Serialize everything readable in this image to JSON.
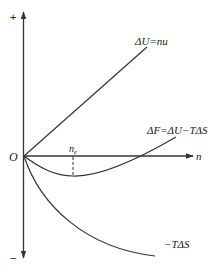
{
  "diagram": {
    "axes": {
      "y_plus_label": "+",
      "y_minus_label": "−",
      "origin_label": "O",
      "x_label": "n"
    },
    "curves": [
      {
        "id": "delta-u",
        "label": "ΔU=nu",
        "shape": "straight line rising from origin"
      },
      {
        "id": "delta-f",
        "label": "ΔF=ΔU−TΔS",
        "shape": "dips below axis to minimum at n_e then rises"
      },
      {
        "id": "minus-t-delta-s",
        "label": "−TΔS",
        "shape": "concave curve falling from origin"
      }
    ],
    "markers": {
      "minimum_label": "n",
      "minimum_subscript": "e"
    },
    "colors": {
      "line": "#333333",
      "background": "#ffffff"
    }
  }
}
